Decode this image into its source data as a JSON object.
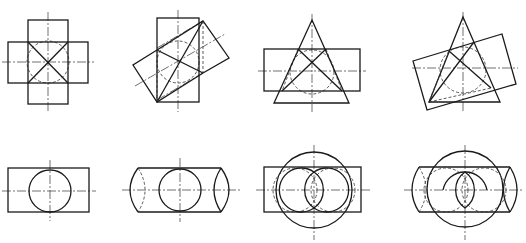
{
  "figure": {
    "colors": {
      "line": "#1a1a1a",
      "background": "#ffffff"
    },
    "panels": [
      {
        "id": "fig-1",
        "row": 1,
        "col": 1,
        "subject": "two square prisms crossing, X intersection lines, hidden circle"
      },
      {
        "id": "fig-2",
        "row": 1,
        "col": 2,
        "subject": "square prism and rotated prism intersection"
      },
      {
        "id": "fig-3",
        "row": 1,
        "col": 3,
        "subject": "cone penetrating horizontal prism"
      },
      {
        "id": "fig-4",
        "row": 1,
        "col": 4,
        "subject": "cone penetrating tilted prism"
      },
      {
        "id": "fig-5",
        "row": 2,
        "col": 1,
        "subject": "cylinder end view over rectangle"
      },
      {
        "id": "fig-6",
        "row": 2,
        "col": 2,
        "subject": "cylinder with curved end sections"
      },
      {
        "id": "fig-7",
        "row": 2,
        "col": 3,
        "subject": "sphere with horizontal cylinder intersection"
      },
      {
        "id": "fig-8",
        "row": 2,
        "col": 4,
        "subject": "sphere with cylinder curved end intersection"
      }
    ]
  }
}
